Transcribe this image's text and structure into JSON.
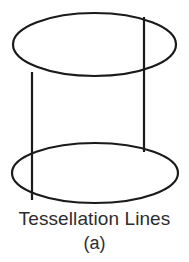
{
  "figure": {
    "caption": "Tessellation Lines",
    "sublabel": "(a)",
    "background_color": "#ffffff",
    "stroke_color": "#1a1a1a",
    "text_color": "#2e2e2e",
    "shape_name": "cylinder-with-tessellation-lines",
    "geometry": {
      "top_ellipse": {
        "cx": 94.5,
        "cy": 44.5,
        "rx": 81.5,
        "ry": 31.5
      },
      "bottom_ellipse": {
        "cx": 95,
        "cy": 173,
        "rx": 83,
        "ry": 30
      },
      "left_line": {
        "x": 32,
        "y1": 72,
        "y2": 200
      },
      "right_line": {
        "x": 144,
        "y1": 17,
        "y2": 152
      },
      "stroke_width": 2.2
    }
  }
}
